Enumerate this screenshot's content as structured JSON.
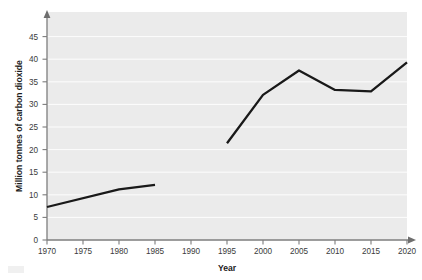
{
  "chart_data": {
    "type": "line",
    "title": "",
    "subtitle": "",
    "xlabel": "Year",
    "ylabel": "Million tonnes of carbon dioxide",
    "xlim": [
      1970,
      2021
    ],
    "ylim": [
      0,
      47
    ],
    "xticks": [
      1970,
      1975,
      1980,
      1985,
      1990,
      1995,
      2000,
      2005,
      2010,
      2015,
      2020
    ],
    "xtick_labels": [
      "1970",
      "1975",
      "1980",
      "1985",
      "1990",
      "1995",
      "2000",
      "2005",
      "2010",
      "2015",
      "2020"
    ],
    "yticks": [
      0,
      5,
      10,
      15,
      20,
      25,
      30,
      35,
      40,
      45
    ],
    "ytick_labels": [
      "0",
      "5",
      "10",
      "15",
      "20",
      "25",
      "30",
      "35",
      "40",
      "45"
    ],
    "grid": "horizontal",
    "legend": "none",
    "line_color": "#191919",
    "background_color": "#ebebeb",
    "gridline_color": "#fdfdfd",
    "axis_color": "#7d7d7d",
    "series": [
      {
        "name": "Carbon dioxide emissions",
        "segments": [
          {
            "x": [
              1970,
              1980,
              1985
            ],
            "y": [
              7.3,
              11.2,
              12.2
            ]
          },
          {
            "x": [
              1995,
              2000,
              2005,
              2010,
              2015,
              2020
            ],
            "y": [
              21.4,
              32.1,
              37.5,
              33.2,
              32.9,
              39.3
            ]
          }
        ]
      }
    ]
  }
}
